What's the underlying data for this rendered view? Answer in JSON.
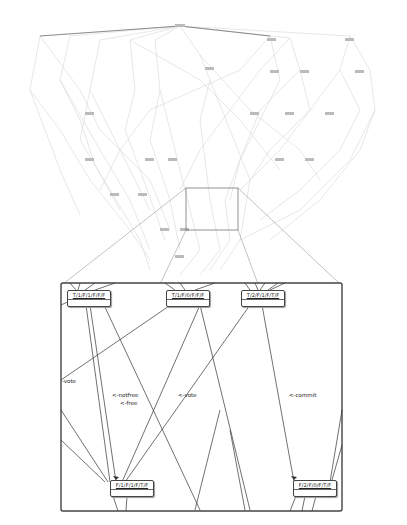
{
  "diagram": {
    "type": "state-space graph with zoom inset",
    "overview": {
      "description": "Large faint state transition graph (overview)",
      "zoom_region": {
        "x": 186,
        "y": 188,
        "w": 52,
        "h": 42
      }
    },
    "inset": {
      "box": {
        "x": 61,
        "y": 283,
        "w": 281,
        "h": 228
      },
      "nodes": [
        {
          "id": "n1",
          "label": "T/1/F/1/F/F/F",
          "x": 67,
          "y": 290
        },
        {
          "id": "n2",
          "label": "T/1/F/0/F/F/F",
          "x": 166,
          "y": 290
        },
        {
          "id": "n3",
          "label": "T/2/F/1/F/T/F",
          "x": 241,
          "y": 290
        },
        {
          "id": "n4",
          "label": "F/1/F/1/F/T/F",
          "x": 110,
          "y": 480
        },
        {
          "id": "n5",
          "label": "F/2/F/0/F/T/F",
          "x": 293,
          "y": 480
        }
      ],
      "edge_labels": [
        {
          "text": "-vote",
          "x": 62,
          "y": 378
        },
        {
          "text": "<-notfree",
          "x": 112,
          "y": 392
        },
        {
          "text": "<-free",
          "x": 120,
          "y": 400
        },
        {
          "text": "<-vote",
          "x": 178,
          "y": 392
        },
        {
          "text": "<-commit",
          "x": 289,
          "y": 392
        }
      ]
    }
  }
}
